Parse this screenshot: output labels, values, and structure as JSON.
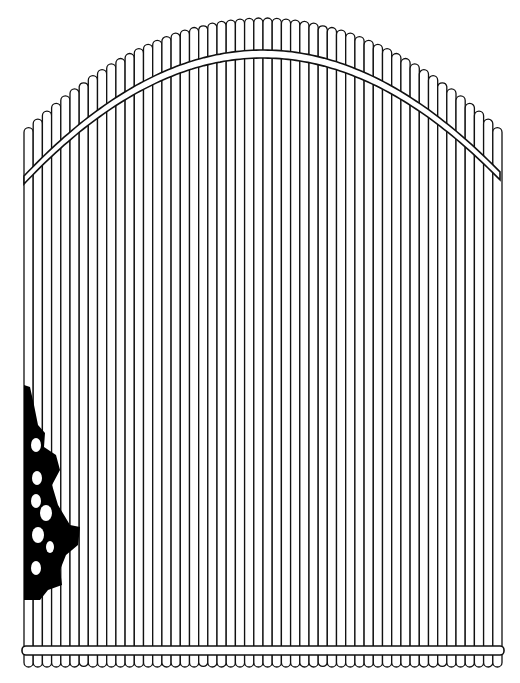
{
  "figure": {
    "type": "line-drawing",
    "caption_cropped": true,
    "colors": {
      "ink": "#111111",
      "paper": "#ffffff",
      "foliage": "#000000"
    }
  },
  "gate": {
    "left_x": 24,
    "right_x": 502,
    "slat_count": 52,
    "arch": {
      "center_x": 263,
      "peak_y": 18,
      "edge_y": 132
    },
    "brace": {
      "peak_top_y": 50,
      "peak_bottom_y": 58,
      "left_end_y": 184,
      "right_end_y": 182,
      "thickness": 8
    },
    "bottom_rail": {
      "top_y": 646,
      "bottom_y": 655
    },
    "scallop_bottom_y": 667
  },
  "foliage": {
    "position": "left-edge",
    "y_range": [
      385,
      600
    ]
  }
}
